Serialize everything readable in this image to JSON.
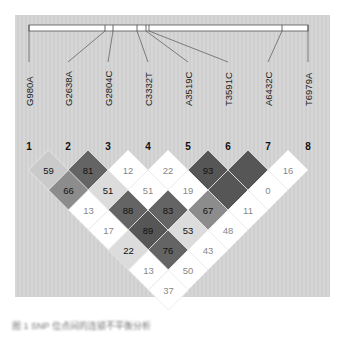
{
  "figure": {
    "type": "linkage-disequilibrium-plot",
    "caption": "图 1  SNP 位点间的连锁不平衡分析"
  },
  "gene_bar": {
    "x_start": 29,
    "x_end": 308,
    "tick_positions": [
      29,
      105,
      113,
      137,
      146,
      149,
      282,
      308
    ]
  },
  "snps": [
    {
      "index": "1",
      "label": "G980A",
      "x": 29
    },
    {
      "index": "2",
      "label": "G2638A",
      "x": 68
    },
    {
      "index": "3",
      "label": "G2804C",
      "x": 108
    },
    {
      "index": "4",
      "label": "C3332T",
      "x": 148
    },
    {
      "index": "5",
      "label": "A3519C",
      "x": 188
    },
    {
      "index": "6",
      "label": "T3591C",
      "x": 228
    },
    {
      "index": "7",
      "label": "A6432C",
      "x": 268
    },
    {
      "index": "8",
      "label": "T6979A",
      "x": 308
    }
  ],
  "colors": {
    "dark": "#565656",
    "mid_dark": "#646464",
    "mid": "#8c8c8c",
    "light": "#cacaca",
    "lighter": "#dcdcdc",
    "white": "#ffffff",
    "text_dark": "#111111",
    "text_light": "#888888"
  },
  "ld_cells": [
    {
      "i": 1,
      "j": 2,
      "value": "59",
      "shade": "light"
    },
    {
      "i": 2,
      "j": 3,
      "value": "81",
      "shade": "mid_dark"
    },
    {
      "i": 3,
      "j": 4,
      "value": "12",
      "shade": "white"
    },
    {
      "i": 4,
      "j": 5,
      "value": "22",
      "shade": "white"
    },
    {
      "i": 5,
      "j": 6,
      "value": "93",
      "shade": "dark"
    },
    {
      "i": 6,
      "j": 7,
      "value": "",
      "shade": "dark"
    },
    {
      "i": 7,
      "j": 8,
      "value": "16",
      "shade": "white"
    },
    {
      "i": 1,
      "j": 3,
      "value": "66",
      "shade": "mid"
    },
    {
      "i": 2,
      "j": 4,
      "value": "51",
      "shade": "lighter"
    },
    {
      "i": 3,
      "j": 5,
      "value": "51",
      "shade": "white"
    },
    {
      "i": 4,
      "j": 6,
      "value": "19",
      "shade": "white"
    },
    {
      "i": 5,
      "j": 7,
      "value": "",
      "shade": "dark"
    },
    {
      "i": 6,
      "j": 8,
      "value": "0",
      "shade": "white"
    },
    {
      "i": 1,
      "j": 4,
      "value": "13",
      "shade": "white"
    },
    {
      "i": 2,
      "j": 5,
      "value": "88",
      "shade": "mid_dark"
    },
    {
      "i": 3,
      "j": 6,
      "value": "83",
      "shade": "mid_dark"
    },
    {
      "i": 4,
      "j": 7,
      "value": "67",
      "shade": "mid"
    },
    {
      "i": 5,
      "j": 8,
      "value": "11",
      "shade": "white"
    },
    {
      "i": 1,
      "j": 5,
      "value": "17",
      "shade": "white"
    },
    {
      "i": 2,
      "j": 6,
      "value": "89",
      "shade": "dark"
    },
    {
      "i": 3,
      "j": 7,
      "value": "53",
      "shade": "lighter"
    },
    {
      "i": 4,
      "j": 8,
      "value": "48",
      "shade": "white"
    },
    {
      "i": 1,
      "j": 6,
      "value": "22",
      "shade": "lighter"
    },
    {
      "i": 2,
      "j": 7,
      "value": "76",
      "shade": "mid_dark"
    },
    {
      "i": 3,
      "j": 8,
      "value": "43",
      "shade": "white"
    },
    {
      "i": 1,
      "j": 7,
      "value": "13",
      "shade": "white"
    },
    {
      "i": 2,
      "j": 8,
      "value": "50",
      "shade": "white"
    },
    {
      "i": 1,
      "j": 8,
      "value": "37",
      "shade": "white"
    }
  ]
}
